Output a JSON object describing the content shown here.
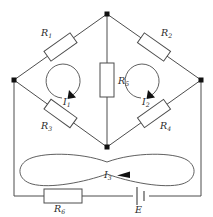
{
  "figure": {
    "background_color": "#ffffff",
    "wire_color": "#4d4d4d",
    "label_color": "#2b2b2b",
    "node_color": "#111111"
  },
  "components": {
    "r1": {
      "label": "R",
      "sub": "1"
    },
    "r2": {
      "label": "R",
      "sub": "2"
    },
    "r3": {
      "label": "R",
      "sub": "3"
    },
    "r4": {
      "label": "R",
      "sub": "4"
    },
    "r5": {
      "label": "R",
      "sub": "5"
    },
    "r6": {
      "label": "R",
      "sub": "6"
    },
    "source": {
      "label": "E"
    }
  },
  "currents": {
    "i1": {
      "label": "I",
      "sub": "1",
      "direction": "clockwise"
    },
    "i2": {
      "label": "I",
      "sub": "2",
      "direction": "clockwise"
    },
    "i3": {
      "label": "I",
      "sub": "3",
      "direction": "counterclockwise"
    }
  }
}
